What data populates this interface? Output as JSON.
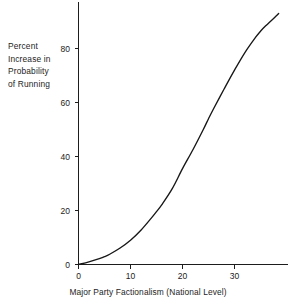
{
  "chart_data": {
    "type": "line",
    "title": "",
    "subtitle": "",
    "xlabel": "Major Party Factionalism (National Level)",
    "ylabel": "Percent Increase in Probability of Running",
    "ylabel_lines": [
      "Percent",
      "Increase in",
      "Probability",
      "of Running"
    ],
    "xlim": [
      0,
      40
    ],
    "ylim": [
      0,
      96
    ],
    "xticks": [
      0,
      10,
      20,
      30
    ],
    "yticks": [
      0,
      20,
      40,
      60,
      80
    ],
    "xticklabels": [
      "0",
      "10",
      "20",
      "30"
    ],
    "yticklabels": [
      "0",
      "20",
      "40",
      "60",
      "80"
    ],
    "grid": false,
    "legend": null,
    "series": [
      {
        "name": "Percent increase in probability of running",
        "x": [
          0,
          2,
          4,
          5,
          6,
          8,
          10,
          12,
          14,
          15,
          16,
          18,
          20,
          22,
          24,
          25,
          26,
          28,
          30,
          32,
          34,
          35,
          36,
          38,
          38.5
        ],
        "values": [
          0,
          1,
          2.2,
          2.9,
          3.8,
          6.1,
          9.0,
          12.7,
          17.2,
          19.6,
          22.1,
          28.0,
          35.5,
          42.5,
          50.0,
          54.0,
          57.8,
          65.0,
          72.0,
          78.5,
          84.0,
          86.4,
          88.4,
          92.0,
          93.0
        ]
      }
    ],
    "line_color": "#171717",
    "axis_color": "#1d1d1d",
    "background_color": "#ffffff"
  },
  "axis_geometry": {
    "x0_px": 78,
    "y0_px": 264.5,
    "x_px_per_unit": 5.2,
    "y_px_per_unit": 2.7,
    "x_axis_end_px": 288,
    "y_axis_top_px": 2
  }
}
